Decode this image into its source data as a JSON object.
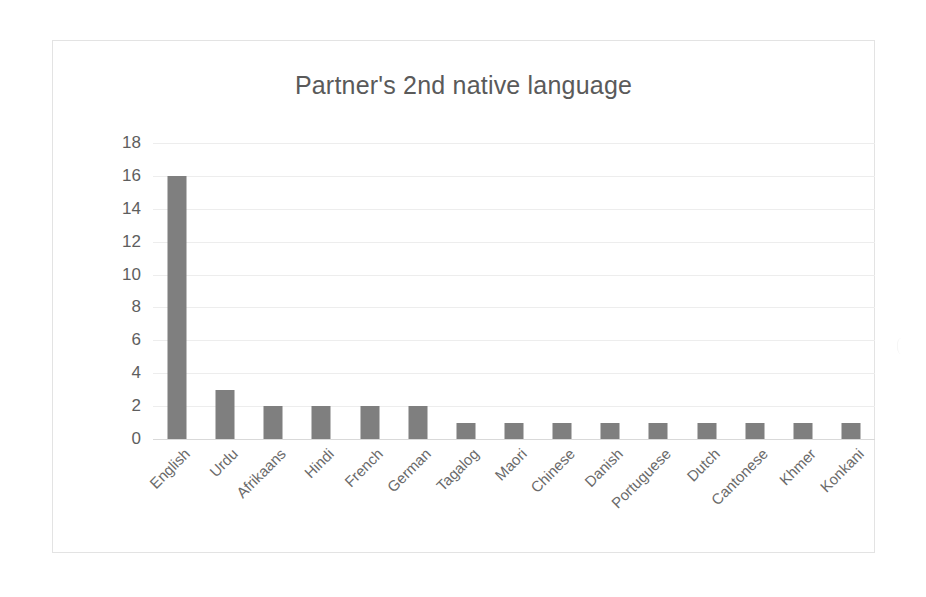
{
  "chart_data": {
    "type": "bar",
    "title": "Partner's 2nd native language",
    "xlabel": "",
    "ylabel": "",
    "ylim": [
      0,
      18
    ],
    "ytick_step": 2,
    "yticks": [
      "18",
      "16",
      "14",
      "12",
      "10",
      "8",
      "6",
      "4",
      "2",
      "0"
    ],
    "grid": true,
    "legend": false,
    "bar_color": "#7f7f7f",
    "categories": [
      "English",
      "Urdu",
      "Afrikaans",
      "Hindi",
      "French",
      "German",
      "Tagalog",
      "Maori",
      "Chinese",
      "Danish",
      "Portuguese",
      "Dutch",
      "Cantonese",
      "Khmer",
      "Konkani"
    ],
    "values": [
      16,
      3,
      2,
      2,
      2,
      2,
      1,
      1,
      1,
      1,
      1,
      1,
      1,
      1,
      1
    ]
  }
}
